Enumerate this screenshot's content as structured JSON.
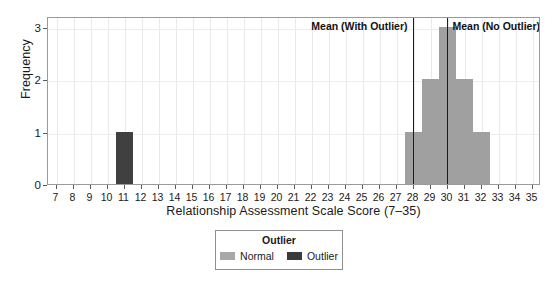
{
  "chart_data": {
    "type": "bar",
    "title": "",
    "subtitle": "",
    "xlabel": "Relationship Assessment Scale Score (7–35)",
    "ylabel": "Frequency",
    "xlim": [
      6.5,
      35.5
    ],
    "ylim": [
      0,
      3.2
    ],
    "grid": true,
    "xticks": [
      7,
      8,
      9,
      10,
      11,
      12,
      13,
      14,
      15,
      16,
      17,
      18,
      19,
      20,
      21,
      22,
      23,
      24,
      25,
      26,
      27,
      28,
      29,
      30,
      31,
      32,
      33,
      34,
      35
    ],
    "xtick_labels": [
      "7",
      "8",
      "9",
      "10",
      "11",
      "12",
      "13",
      "14",
      "15",
      "16",
      "17",
      "18",
      "19",
      "20",
      "21",
      "22",
      "23",
      "24",
      "25",
      "26",
      "27",
      "28",
      "29",
      "30",
      "31",
      "32",
      "33",
      "34",
      "35"
    ],
    "yticks": [
      0,
      1,
      2,
      3
    ],
    "ytick_labels": [
      "0",
      "1",
      "2",
      "3"
    ],
    "bin_width": 1,
    "bars": [
      {
        "center": 11,
        "start": 10.5,
        "end": 11.5,
        "value": 1,
        "group": "Outlier"
      },
      {
        "center": 28,
        "start": 27.5,
        "end": 28.5,
        "value": 1,
        "group": "Normal"
      },
      {
        "center": 29,
        "start": 28.5,
        "end": 29.5,
        "value": 2,
        "group": "Normal"
      },
      {
        "center": 30,
        "start": 29.5,
        "end": 30.5,
        "value": 3,
        "group": "Normal"
      },
      {
        "center": 31,
        "start": 30.5,
        "end": 31.5,
        "value": 2,
        "group": "Normal"
      },
      {
        "center": 32,
        "start": 31.5,
        "end": 32.5,
        "value": 1,
        "group": "Normal"
      }
    ],
    "reference_lines": [
      {
        "id": "mean-with-outlier",
        "label": "Mean (With Outlier)",
        "x": 28.0,
        "label_align": "right"
      },
      {
        "id": "mean-no-outlier",
        "label": "Mean (No Outlier)",
        "x": 30.0,
        "label_align": "left"
      }
    ],
    "colors": {
      "normal": "#a0a0a0",
      "outlier": "#404040",
      "reference_line": "#1c1c1c",
      "grid": "#e9e9e9",
      "frame": "#9a9a9a",
      "background": "#ffffff"
    }
  },
  "legend": {
    "title": "Outlier",
    "position": "bottom",
    "items": [
      {
        "label": "Normal",
        "color": "#a8a8a8"
      },
      {
        "label": "Outlier",
        "color": "#3a3a3a"
      }
    ]
  }
}
